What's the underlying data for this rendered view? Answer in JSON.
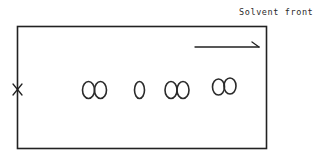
{
  "diagram": {
    "type": "thin-layer chromatography plate",
    "labels": {
      "solvent_front": "Solvent front"
    },
    "plate": {
      "x": 17,
      "y": 26,
      "width": 249,
      "height": 122,
      "stroke": "#222222"
    },
    "origin_mark": {
      "symbol": "x",
      "x": 17,
      "y": 90
    },
    "direction_arrow": {
      "x1": 195,
      "y1": 47,
      "x2": 258,
      "y2": 47,
      "meaning": "solvent flow direction"
    },
    "spots": [
      {
        "group": 1,
        "count": 2,
        "centers_x": [
          88,
          101
        ],
        "center_y": 90
      },
      {
        "group": 2,
        "count": 1,
        "centers_x": [
          139
        ],
        "center_y": 90
      },
      {
        "group": 3,
        "count": 2,
        "centers_x": [
          171,
          184
        ],
        "center_y": 90
      },
      {
        "group": 4,
        "count": 2,
        "centers_x": [
          218,
          231
        ],
        "center_y": 87
      }
    ],
    "colors": {
      "ink": "#222222",
      "background": "#ffffff"
    }
  }
}
